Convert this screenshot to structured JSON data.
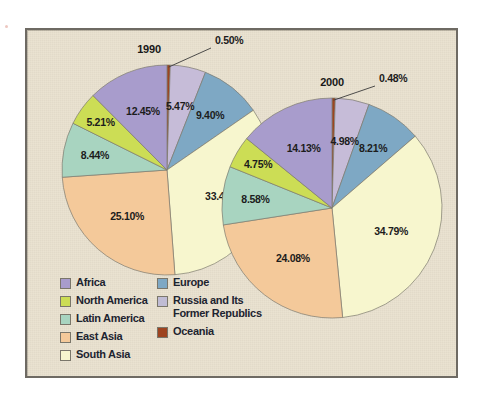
{
  "panel": {
    "background_color": "#e8e0cd",
    "border_color": "#6e6a63"
  },
  "legend": {
    "left_column": [
      {
        "label": "Africa",
        "color": "#a89ccc"
      },
      {
        "label": "North America",
        "color": "#ccdd55"
      },
      {
        "label": "Latin America",
        "color": "#a8d4c0"
      },
      {
        "label": "East Asia",
        "color": "#f4c99a"
      },
      {
        "label": "South Asia",
        "color": "#f7f6ce"
      }
    ],
    "right_column": [
      {
        "label": "Europe",
        "color": "#7ea8c4"
      },
      {
        "label": "Russia and Its\nFormer Republics",
        "color": "#c0bcd4"
      },
      {
        "label": "Oceania",
        "color": "#9e4420"
      }
    ]
  },
  "chart_data": [
    {
      "type": "pie",
      "title": "1990",
      "start_angle_deg": 0,
      "direction": "clockwise",
      "center": {
        "x": 140,
        "y": 140
      },
      "radius": 105,
      "labels": [
        "Oceania",
        "Russia and Its Former Republics",
        "Europe",
        "South Asia",
        "East Asia",
        "Latin America",
        "North America",
        "Africa"
      ],
      "values": [
        0.5,
        5.47,
        9.4,
        33.43,
        25.1,
        8.44,
        5.21,
        12.45
      ],
      "value_labels": [
        "0.50%",
        "5.47%",
        "9.40%",
        "33.43%",
        "25.10%",
        "8.44%",
        "5.21%",
        "12.45%"
      ],
      "colors": [
        "#9e4420",
        "#c6bcd8",
        "#7ea8c4",
        "#f7f6ce",
        "#f4c99a",
        "#a8d4c0",
        "#ccdd55",
        "#a89ccc"
      ],
      "callout": {
        "label": "0.50%",
        "x": 188,
        "y": 14
      }
    },
    {
      "type": "pie",
      "title": "2000",
      "start_angle_deg": 0,
      "direction": "clockwise",
      "center": {
        "x": 305,
        "y": 178
      },
      "radius": 110,
      "labels": [
        "Oceania",
        "Russia and Its Former Republics",
        "Europe",
        "South Asia",
        "East Asia",
        "Latin America",
        "North America",
        "Africa"
      ],
      "values": [
        0.48,
        4.98,
        8.21,
        34.79,
        24.08,
        8.58,
        4.75,
        14.13
      ],
      "value_labels": [
        "0.48%",
        "4.98%",
        "8.21%",
        "34.79%",
        "24.08%",
        "8.58%",
        "4.75%",
        "14.13%"
      ],
      "colors": [
        "#9e4420",
        "#c6bcd8",
        "#7ea8c4",
        "#f7f6ce",
        "#f4c99a",
        "#a8d4c0",
        "#ccdd55",
        "#a89ccc"
      ],
      "callout": {
        "label": "0.48%",
        "x": 352,
        "y": 52
      }
    }
  ]
}
